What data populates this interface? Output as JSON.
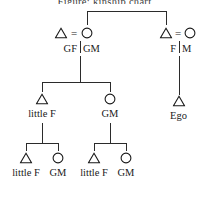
{
  "title": "Figure: kinship chart",
  "diagram": {
    "type": "kinship-chart",
    "symbols": {
      "male": "triangle",
      "female": "circle",
      "marriage": "="
    },
    "generation1": {
      "couple_left": {
        "male_label": "GF",
        "female_label": "GM",
        "marriage_sign": "="
      },
      "couple_right": {
        "male_label": "F",
        "female_label": "M",
        "marriage_sign": "="
      }
    },
    "generation2": {
      "child_left_male": "little F",
      "child_mid_female": "GM",
      "child_right_male": "Ego"
    },
    "generation3": {
      "pair_left": {
        "male_label": "little F",
        "female_label": "GM"
      },
      "pair_right": {
        "male_label": "little F",
        "female_label": "GM"
      }
    }
  },
  "colors": {
    "ink": "#1a1a1a",
    "line": "#2b2b2b",
    "background": "#ffffff"
  }
}
